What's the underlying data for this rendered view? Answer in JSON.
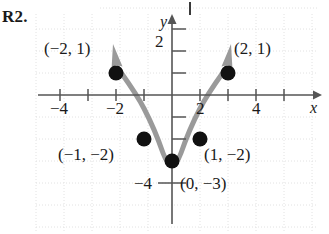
{
  "exercise": {
    "label": "R2."
  },
  "graph": {
    "axes": {
      "x_name": "x",
      "y_name": "y",
      "x_tick_labels": [
        {
          "value": -4,
          "text": "−4"
        },
        {
          "value": -2,
          "text": "−2"
        },
        {
          "value": 2,
          "text": "2"
        },
        {
          "value": 4,
          "text": "4"
        }
      ],
      "y_tick_labels": [
        {
          "value": 2,
          "text": "2"
        },
        {
          "value": -4,
          "text": "−4"
        }
      ],
      "xlim": [
        -4.8,
        5.3
      ],
      "ylim": [
        -4.9,
        3.2
      ],
      "tick_step": 1,
      "grid": "faint-dotted"
    },
    "curve": {
      "type": "parabola",
      "equation": "y = x² − 3",
      "color": "#9a9a9a",
      "stroke_width": 5,
      "arrow_ends": [
        "left-up",
        "right-up"
      ]
    },
    "points": [
      {
        "x": -2,
        "y": 1,
        "label": "(−2, 1)",
        "label_side": "left"
      },
      {
        "x": -1,
        "y": -2,
        "label": "(−1, −2)",
        "label_side": "left-below"
      },
      {
        "x": 0,
        "y": -3,
        "label": "(0, −3)",
        "label_side": "right-below"
      },
      {
        "x": 1,
        "y": -2,
        "label": "(1, −2)",
        "label_side": "right-below"
      },
      {
        "x": 2,
        "y": 1,
        "label": "(2, 1)",
        "label_side": "right"
      }
    ],
    "point_color": "#111111",
    "axis_color": "#555555"
  }
}
